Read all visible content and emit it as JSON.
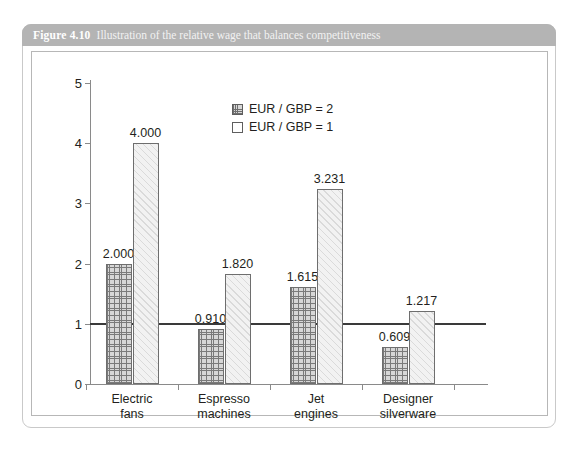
{
  "figure": {
    "number": "Figure 4.10",
    "caption": "Illustration of the relative wage that balances competitiveness"
  },
  "chart_data": {
    "type": "bar",
    "title": "Illustration of the relative wage that balances competitiveness",
    "xlabel": "",
    "ylabel": "",
    "ylim": [
      0,
      5
    ],
    "yticks": [
      "0",
      "1",
      "2",
      "3",
      "4",
      "5"
    ],
    "grid": false,
    "legend_position": "top-center",
    "categories": [
      "Electric fans",
      "Espresso machines",
      "Jet engines",
      "Designer silverware"
    ],
    "category_lines": [
      [
        "Electric",
        "fans"
      ],
      [
        "Espresso",
        "machines"
      ],
      [
        "Jet",
        "engines"
      ],
      [
        "Designer",
        "silverware"
      ]
    ],
    "series": [
      {
        "name": "EUR / GBP = 2",
        "values": [
          2.0,
          0.91,
          1.615,
          0.609
        ],
        "labels": [
          "2.000",
          "0.910",
          "1.615",
          "0.609"
        ]
      },
      {
        "name": "EUR / GBP = 1",
        "values": [
          4.0,
          1.82,
          3.231,
          1.217
        ],
        "labels": [
          "4.000",
          "1.820",
          "3.231",
          "1.217"
        ]
      }
    ],
    "annotations": [
      {
        "type": "hline",
        "y": 1,
        "label": ""
      }
    ]
  },
  "colors": {
    "header_bar": "#b4b4b4",
    "card_border": "#c9c9c9",
    "axis": "#8a8a8a",
    "reference_line": "#3a3a3a",
    "text": "#231f20"
  }
}
